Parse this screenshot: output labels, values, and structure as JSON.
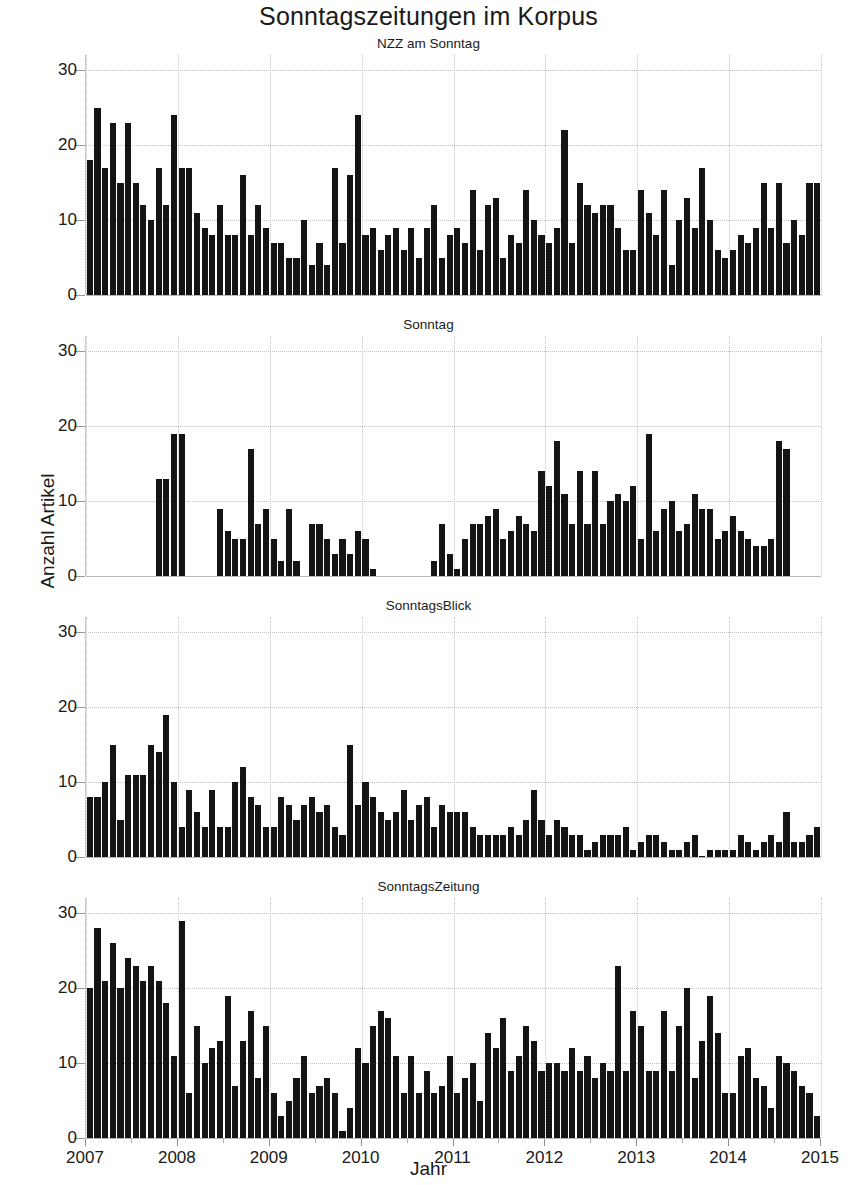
{
  "chart_data": {
    "type": "bar",
    "title": "Sonntagszeitungen im Korpus",
    "xlabel": "Jahr",
    "ylabel": "Anzahl Artikel",
    "grid": true,
    "legend_position": "none",
    "ylim": [
      0,
      32
    ],
    "yticks": [
      0,
      10,
      20,
      30
    ],
    "xlim": [
      "2007-01",
      "2015-01"
    ],
    "xticks": [
      "2007",
      "2008",
      "2009",
      "2010",
      "2011",
      "2012",
      "2013",
      "2014",
      "2015"
    ],
    "x_unit": "month",
    "x_start": "2007-01",
    "n_points": 96,
    "bar_color": "#141414",
    "panels": [
      {
        "name": "NZZ am Sonntag",
        "values": [
          18,
          25,
          17,
          23,
          15,
          23,
          15,
          12,
          10,
          17,
          12,
          24,
          17,
          17,
          11,
          9,
          8,
          12,
          8,
          8,
          16,
          8,
          12,
          9,
          7,
          7,
          5,
          5,
          10,
          4,
          7,
          4,
          17,
          7,
          16,
          24,
          8,
          9,
          6,
          8,
          9,
          6,
          9,
          5,
          9,
          12,
          5,
          8,
          9,
          7,
          14,
          6,
          12,
          13,
          5,
          8,
          7,
          14,
          10,
          8,
          7,
          9,
          22,
          7,
          15,
          12,
          11,
          12,
          12,
          9,
          6,
          6,
          14,
          11,
          8,
          14,
          4,
          10,
          13,
          9,
          17,
          10,
          6,
          5,
          6,
          8,
          7,
          9,
          15,
          9,
          15,
          7,
          10,
          8,
          15,
          15
        ]
      },
      {
        "name": "Sonntag",
        "values": [
          null,
          null,
          null,
          null,
          null,
          null,
          null,
          null,
          null,
          13,
          13,
          19,
          19,
          null,
          null,
          null,
          null,
          9,
          6,
          5,
          5,
          17,
          7,
          9,
          5,
          2,
          9,
          2,
          null,
          7,
          7,
          5,
          3,
          5,
          3,
          6,
          5,
          1,
          null,
          null,
          null,
          null,
          null,
          null,
          null,
          2,
          7,
          3,
          1,
          5,
          7,
          7,
          8,
          9,
          5,
          6,
          8,
          7,
          6,
          14,
          12,
          18,
          11,
          7,
          14,
          7,
          14,
          7,
          10,
          11,
          10,
          12,
          5,
          19,
          6,
          9,
          10,
          6,
          7,
          11,
          9,
          9,
          5,
          6,
          8,
          6,
          5,
          4,
          4,
          5,
          18,
          17,
          null,
          null,
          null
        ]
      },
      {
        "name": "SonntagsBlick",
        "values": [
          8,
          8,
          10,
          15,
          5,
          11,
          11,
          11,
          15,
          14,
          19,
          10,
          4,
          9,
          6,
          4,
          9,
          4,
          4,
          10,
          12,
          8,
          7,
          4,
          4,
          8,
          7,
          5,
          7,
          8,
          6,
          7,
          4,
          3,
          15,
          7,
          10,
          8,
          6,
          5,
          6,
          9,
          5,
          7,
          8,
          4,
          7,
          6,
          6,
          6,
          4,
          3,
          3,
          3,
          3,
          4,
          3,
          5,
          9,
          5,
          3,
          5,
          4,
          3,
          3,
          1,
          2,
          3,
          3,
          3,
          4,
          1,
          2,
          3,
          3,
          2,
          1,
          1,
          2,
          3,
          0,
          1,
          1,
          1,
          1,
          3,
          2,
          1,
          2,
          3,
          2,
          6,
          2,
          2,
          3,
          4
        ]
      },
      {
        "name": "SonntagsZeitung",
        "values": [
          20,
          28,
          21,
          26,
          20,
          24,
          23,
          21,
          23,
          21,
          18,
          11,
          29,
          6,
          15,
          10,
          12,
          13,
          19,
          7,
          13,
          17,
          8,
          15,
          6,
          3,
          5,
          8,
          11,
          6,
          7,
          8,
          6,
          1,
          4,
          12,
          10,
          15,
          17,
          16,
          11,
          6,
          11,
          6,
          9,
          6,
          7,
          11,
          6,
          8,
          10,
          5,
          14,
          12,
          16,
          9,
          11,
          15,
          13,
          9,
          10,
          10,
          9,
          12,
          9,
          11,
          8,
          10,
          9,
          23,
          9,
          17,
          15,
          9,
          9,
          17,
          9,
          15,
          20,
          8,
          13,
          19,
          14,
          6,
          6,
          11,
          12,
          8,
          7,
          4,
          11,
          10,
          9,
          7,
          6,
          3
        ]
      }
    ]
  }
}
